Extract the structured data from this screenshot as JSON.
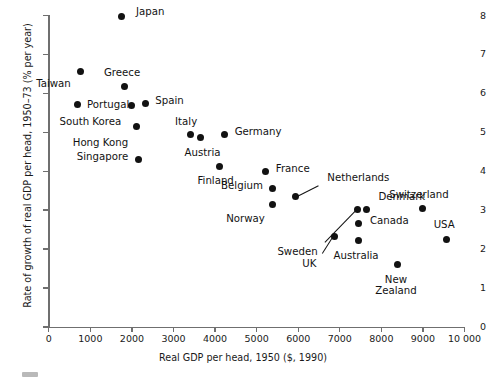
{
  "chart_data": {
    "type": "scatter",
    "title": "",
    "xlabel": "Real GDP per head, 1950 ($, 1990)",
    "ylabel": "Rate of growth of real GDP per head, 1950–73 (% per year)",
    "xlim": [
      0,
      10000
    ],
    "ylim": [
      0,
      8
    ],
    "xticks": [
      0,
      1000,
      2000,
      3000,
      4000,
      5000,
      6000,
      7000,
      8000,
      9000,
      10000
    ],
    "xtick_labels": [
      "0",
      "1000",
      "2000",
      "3000",
      "4000",
      "5000",
      "6000",
      "7000",
      "8000",
      "9000",
      "10 000"
    ],
    "yticks": [
      0,
      1,
      2,
      3,
      4,
      5,
      6,
      7,
      8
    ],
    "ytick_labels": [
      "0",
      "1",
      "2",
      "3",
      "4",
      "5",
      "6",
      "7",
      "8"
    ],
    "grid": false,
    "legend": false,
    "marker": "filled-circle",
    "marker_color": "#121212",
    "points": [
      {
        "label": "Japan",
        "x": 1760,
        "y": 7.97,
        "lx": 14,
        "ly": -5,
        "align": "left"
      },
      {
        "label": "Taiwan",
        "x": 770,
        "y": 6.55,
        "lx": -10,
        "ly": 12,
        "align": "right"
      },
      {
        "label": "Greece",
        "x": 1810,
        "y": 6.18,
        "lx": -2,
        "ly": -14,
        "align": "center"
      },
      {
        "label": "Portugal",
        "x": 680,
        "y": 5.72,
        "lx": 10,
        "ly": 0,
        "align": "left"
      },
      {
        "label": "South Korea",
        "x": 1990,
        "y": 5.7,
        "lx": -72,
        "ly": 16,
        "align": "left"
      },
      {
        "label": "Spain",
        "x": 2320,
        "y": 5.75,
        "lx": 10,
        "ly": -3,
        "align": "left"
      },
      {
        "label": "Hong Kong",
        "x": 2100,
        "y": 5.16,
        "lx": -8,
        "ly": 16,
        "align": "right"
      },
      {
        "label": "Italy",
        "x": 3400,
        "y": 4.95,
        "lx": -4,
        "ly": -13,
        "align": "center"
      },
      {
        "label": "Austria",
        "x": 3650,
        "y": 4.87,
        "lx": 2,
        "ly": 15,
        "align": "center"
      },
      {
        "label": "Germany",
        "x": 4230,
        "y": 4.95,
        "lx": 10,
        "ly": -3,
        "align": "left"
      },
      {
        "label": "Singapore",
        "x": 2150,
        "y": 4.3,
        "lx": -10,
        "ly": -3,
        "align": "right"
      },
      {
        "label": "Finland",
        "x": 4110,
        "y": 4.12,
        "lx": -4,
        "ly": 14,
        "align": "center"
      },
      {
        "label": "France",
        "x": 5220,
        "y": 4.0,
        "lx": 10,
        "ly": -3,
        "align": "left"
      },
      {
        "label": "Belgium",
        "x": 5390,
        "y": 3.55,
        "lx": -10,
        "ly": -3,
        "align": "right"
      },
      {
        "label": "Norway",
        "x": 5390,
        "y": 3.15,
        "lx": -8,
        "ly": 14,
        "align": "right"
      },
      {
        "label": "Netherlands",
        "x": 5930,
        "y": 3.35,
        "lx": 32,
        "ly": -19,
        "align": "left",
        "leader": true
      },
      {
        "label": "Sweden",
        "x": 7430,
        "y": 3.02,
        "lx": -40,
        "ly": 42,
        "align": "right",
        "leader": true
      },
      {
        "label": "Denmark",
        "x": 7640,
        "y": 3.02,
        "lx": 12,
        "ly": -13,
        "align": "left"
      },
      {
        "label": "Switzerland",
        "x": 9000,
        "y": 3.05,
        "lx": -4,
        "ly": -14,
        "align": "center"
      },
      {
        "label": "Canada",
        "x": 7460,
        "y": 2.65,
        "lx": 11,
        "ly": -3,
        "align": "left"
      },
      {
        "label": "USA",
        "x": 9560,
        "y": 2.25,
        "lx": -2,
        "ly": -15,
        "align": "center"
      },
      {
        "label": "UK",
        "x": 6870,
        "y": 2.33,
        "lx": -18,
        "ly": 27,
        "align": "right",
        "leader": true
      },
      {
        "label": "Australia",
        "x": 7440,
        "y": 2.22,
        "lx": -2,
        "ly": 15,
        "align": "center"
      },
      {
        "label": "New Zealand",
        "x": 8400,
        "y": 1.6,
        "lx": -2,
        "ly": 15,
        "align": "center",
        "twoline": "New\nZealand"
      }
    ]
  }
}
